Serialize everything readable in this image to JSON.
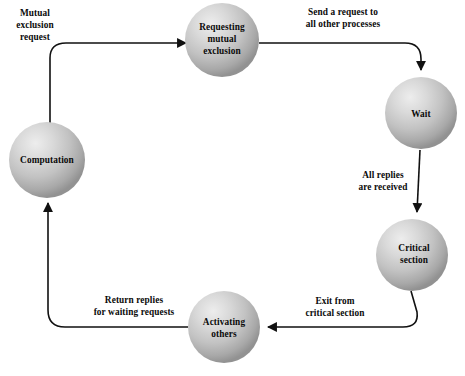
{
  "diagram": {
    "type": "state-cycle",
    "colors": {
      "background": "#ffffff",
      "edge": "#111111",
      "text": "#0a0a0a",
      "sphere_highlight": "#e8e8e8",
      "sphere_mid": "#bdbdbd",
      "sphere_edge": "#8f8f8f"
    },
    "nodes": [
      {
        "id": "computation",
        "label_lines": [
          "Computation"
        ],
        "cx": 47,
        "cy": 160,
        "r": 38
      },
      {
        "id": "requesting-mutual-exclusion",
        "label_lines": [
          "Requesting",
          "mutual",
          "exclusion"
        ],
        "cx": 222,
        "cy": 40,
        "r": 37
      },
      {
        "id": "wait",
        "label_lines": [
          "Wait"
        ],
        "cx": 421,
        "cy": 113,
        "r": 36
      },
      {
        "id": "critical-section",
        "label_lines": [
          "Critical",
          "section"
        ],
        "cx": 412,
        "cy": 255,
        "r": 36
      },
      {
        "id": "activating-others",
        "label_lines": [
          "Activating",
          "others"
        ],
        "cx": 224,
        "cy": 327,
        "r": 36
      }
    ],
    "edges": [
      {
        "id": "computation-to-requesting",
        "from": "computation",
        "to": "requesting-mutual-exclusion",
        "label_lines": [
          "Mutual",
          "exclusion",
          "request"
        ],
        "label_x": 35,
        "label_y": 16
      },
      {
        "id": "requesting-to-wait",
        "from": "requesting-mutual-exclusion",
        "to": "wait",
        "label_lines": [
          "Send a request to",
          "all other processes"
        ],
        "label_x": 343,
        "label_y": 15
      },
      {
        "id": "wait-to-critical-section",
        "from": "wait",
        "to": "critical-section",
        "label_lines": [
          "All replies",
          "are received"
        ],
        "label_x": 383,
        "label_y": 178
      },
      {
        "id": "critical-section-to-activating",
        "from": "critical-section",
        "to": "activating-others",
        "label_lines": [
          "Exit from",
          "critical section"
        ],
        "label_x": 335,
        "label_y": 304
      },
      {
        "id": "activating-to-computation",
        "from": "activating-others",
        "to": "computation",
        "label_lines": [
          "Return replies",
          "for waiting requests"
        ],
        "label_x": 134,
        "label_y": 303
      }
    ]
  }
}
